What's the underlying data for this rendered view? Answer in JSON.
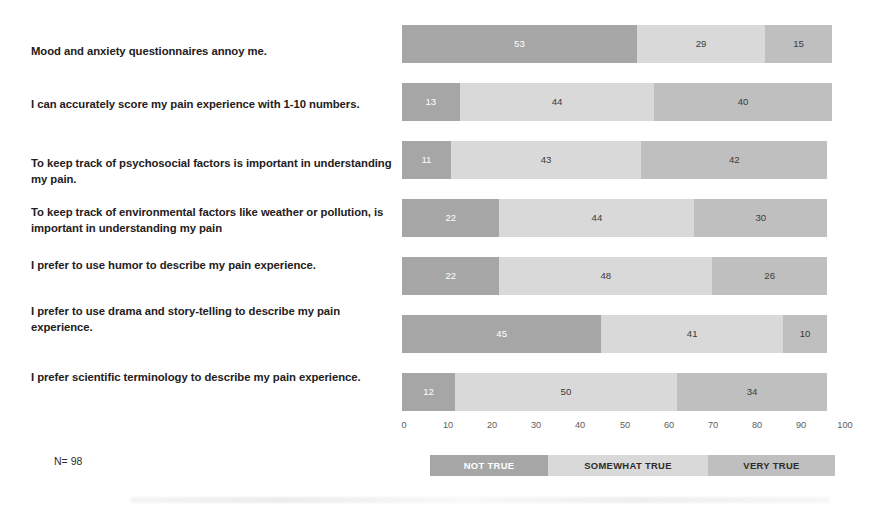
{
  "figure": {
    "sample_note": "N= 98"
  },
  "legend": {
    "items": [
      {
        "label": "NOT TRUE",
        "color": "#a6a6a6"
      },
      {
        "label": "SOMEWHAT TRUE",
        "color": "#d9d9d9"
      },
      {
        "label": "VERY TRUE",
        "color": "#bfbfbf"
      }
    ]
  },
  "axis": {
    "ticks": [
      "0",
      "10",
      "20",
      "30",
      "40",
      "50",
      "60",
      "70",
      "80",
      "90",
      "100"
    ]
  },
  "chart_data": {
    "type": "bar",
    "title": "",
    "subtitle": "",
    "xlabel": "",
    "ylabel": "",
    "orientation": "horizontal",
    "stacked": true,
    "stack_mode": "percent",
    "xlim": [
      0,
      100
    ],
    "grid": false,
    "legend_position": "bottom",
    "annotations": [
      "N= 98"
    ],
    "categories": [
      "Mood and anxiety questionnaires annoy me.",
      "I can accurately score my pain experience with 1-10 numbers.",
      "To keep track of psychosocial factors is important in understanding my pain.",
      "To keep track of environmental factors like weather or pollution, is important in understanding my pain",
      "I prefer to use humor to describe my pain experience.",
      "I prefer to use drama and story-telling to describe my pain experience.",
      "I prefer scientific terminology to describe my pain experience."
    ],
    "series": [
      {
        "name": "NOT TRUE",
        "color": "#a6a6a6",
        "values": [
          53,
          13,
          11,
          22,
          22,
          45,
          12
        ]
      },
      {
        "name": "SOMEWHAT TRUE",
        "color": "#d9d9d9",
        "values": [
          29,
          44,
          43,
          44,
          48,
          41,
          50
        ]
      },
      {
        "name": "VERY TRUE",
        "color": "#bfbfbf",
        "values": [
          15,
          40,
          42,
          30,
          26,
          10,
          34
        ]
      }
    ]
  }
}
